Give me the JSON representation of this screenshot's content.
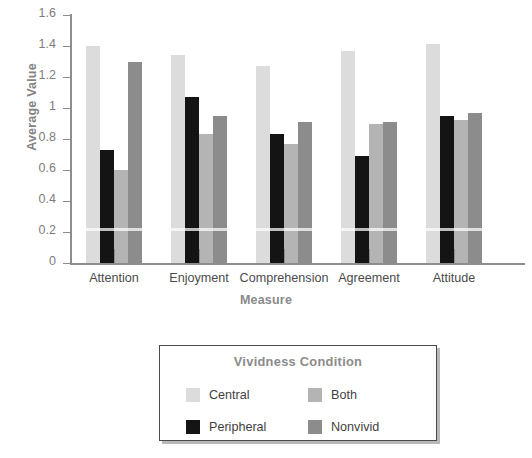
{
  "chart_data": {
    "type": "bar",
    "title": "",
    "xlabel": "Measure",
    "ylabel": "Average Value",
    "ylim": [
      0,
      1.6
    ],
    "ytick_labels": [
      "0",
      "0.2",
      "0.4",
      "0.6",
      "0.8",
      "1",
      "1.2",
      "1.4",
      "1.6"
    ],
    "ytick_values": [
      0,
      0.2,
      0.4,
      0.6,
      0.8,
      1.0,
      1.2,
      1.4,
      1.6
    ],
    "grid": false,
    "legend_position": "below-plot",
    "legend_title": "Vividness Condition",
    "categories": [
      "Attention",
      "Enjoyment",
      "Comprehension",
      "Agreement",
      "Attitude"
    ],
    "series": [
      {
        "name": "Central",
        "color": "#dcdcdc",
        "values": [
          1.4,
          1.34,
          1.27,
          1.37,
          1.41
        ]
      },
      {
        "name": "Peripheral",
        "color": "#141414",
        "values": [
          0.73,
          1.07,
          0.83,
          0.69,
          0.95
        ]
      },
      {
        "name": "Both",
        "color": "#b4b4b4",
        "values": [
          0.6,
          0.83,
          0.77,
          0.9,
          0.92
        ]
      },
      {
        "name": "Nonvivid",
        "color": "#8c8c8c",
        "values": [
          1.3,
          0.95,
          0.91,
          0.91,
          0.97
        ]
      }
    ]
  },
  "legend": {
    "title": "Vividness Condition",
    "items": [
      {
        "label": "Central",
        "color": "#dcdcdc"
      },
      {
        "label": "Both",
        "color": "#b4b4b4"
      },
      {
        "label": "Peripheral",
        "color": "#141414"
      },
      {
        "label": "Nonvivid",
        "color": "#8c8c8c"
      }
    ]
  },
  "axes": {
    "y_title": "Average Value",
    "x_title": "Measure"
  }
}
